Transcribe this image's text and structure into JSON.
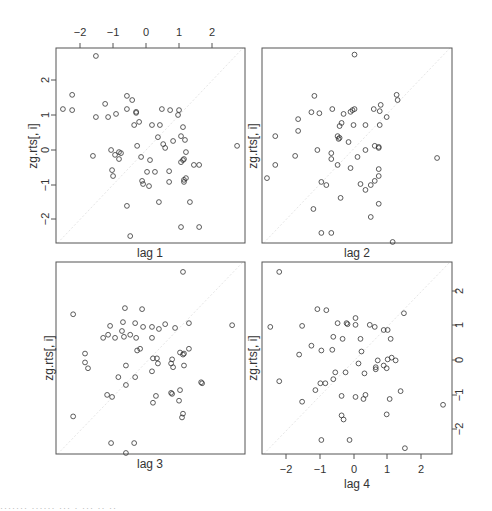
{
  "chart_data": {
    "type": "scatter",
    "title": "",
    "ylabel": "zg.rts[, i]",
    "axis_ticks": [
      -2,
      -1,
      0,
      1,
      2
    ],
    "xlim": [
      -2.73,
      3.0
    ],
    "ylim": [
      -2.68,
      2.94
    ],
    "grid": false,
    "reference_line": "y = x (faint dotted diagonal)",
    "panels": [
      {
        "xlabel": "lag 1",
        "position": "top-left",
        "axes": "top x-axis ticks, left y-axis ticks",
        "points": [
          [
            -1.52,
            2.71
          ],
          [
            -2.24,
            1.59
          ],
          [
            -2.52,
            1.18
          ],
          [
            -2.24,
            1.15
          ],
          [
            -1.24,
            1.33
          ],
          [
            -1.52,
            0.95
          ],
          [
            -1.15,
            0.95
          ],
          [
            -0.91,
            1.04
          ],
          [
            -0.58,
            1.56
          ],
          [
            -0.42,
            1.44
          ],
          [
            -0.58,
            1.18
          ],
          [
            -0.3,
            1.07
          ],
          [
            -0.3,
            1.1
          ],
          [
            -0.21,
            0.81
          ],
          [
            -0.36,
            0.72
          ],
          [
            0.48,
            1.18
          ],
          [
            0.73,
            1.15
          ],
          [
            1.0,
            1.15
          ],
          [
            0.42,
            0.72
          ],
          [
            0.18,
            0.72
          ],
          [
            0.36,
            0.37
          ],
          [
            1.12,
            0.66
          ],
          [
            1.06,
            0.4
          ],
          [
            0.97,
            1.01
          ],
          [
            1.18,
            0.29
          ],
          [
            0.82,
            0.26
          ],
          [
            0.52,
            0.17
          ],
          [
            0.58,
            0.06
          ],
          [
            -0.27,
            0.12
          ],
          [
            -1.06,
            0.0
          ],
          [
            -0.82,
            -0.06
          ],
          [
            -0.94,
            -0.14
          ],
          [
            -0.76,
            -0.09
          ],
          [
            -0.82,
            -0.26
          ],
          [
            -1.61,
            -0.17
          ],
          [
            -0.15,
            -0.2
          ],
          [
            0.12,
            -0.29
          ],
          [
            0.03,
            -0.63
          ],
          [
            -1.03,
            -0.58
          ],
          [
            -1.0,
            -0.75
          ],
          [
            0.27,
            -0.63
          ],
          [
            0.7,
            -0.61
          ],
          [
            -0.12,
            -0.89
          ],
          [
            -0.09,
            -0.98
          ],
          [
            0.09,
            -1.04
          ],
          [
            0.7,
            -0.92
          ],
          [
            1.15,
            -0.86
          ],
          [
            1.15,
            -0.92
          ],
          [
            1.21,
            -0.81
          ],
          [
            1.45,
            -0.43
          ],
          [
            1.61,
            -0.43
          ],
          [
            1.21,
            -0.06
          ],
          [
            1.15,
            -0.26
          ],
          [
            1.12,
            -0.29
          ],
          [
            1.06,
            -0.35
          ],
          [
            2.76,
            0.12
          ],
          [
            0.39,
            -1.5
          ],
          [
            -0.58,
            -1.61
          ],
          [
            1.33,
            -1.5
          ],
          [
            1.06,
            -2.22
          ],
          [
            1.61,
            -2.22
          ],
          [
            -0.48,
            -2.48
          ]
        ]
      },
      {
        "xlabel": "lag 2",
        "position": "top-right",
        "axes": "no tick labels",
        "points": [
          [
            0.06,
            2.75
          ],
          [
            -1.15,
            1.56
          ],
          [
            1.33,
            1.59
          ],
          [
            1.36,
            1.44
          ],
          [
            -1.24,
            1.09
          ],
          [
            -1.0,
            1.06
          ],
          [
            -0.61,
            1.18
          ],
          [
            -0.27,
            1.04
          ],
          [
            -0.06,
            1.1
          ],
          [
            0.0,
            1.15
          ],
          [
            0.06,
            1.18
          ],
          [
            0.64,
            1.18
          ],
          [
            0.82,
            1.12
          ],
          [
            0.85,
            1.3
          ],
          [
            1.03,
            0.95
          ],
          [
            -0.39,
            0.69
          ],
          [
            -0.33,
            0.78
          ],
          [
            0.03,
            0.72
          ],
          [
            0.39,
            0.72
          ],
          [
            0.82,
            0.72
          ],
          [
            -1.64,
            0.89
          ],
          [
            -2.33,
            0.4
          ],
          [
            -1.64,
            0.55
          ],
          [
            -0.45,
            0.4
          ],
          [
            -0.39,
            0.35
          ],
          [
            -0.42,
            0.32
          ],
          [
            -0.12,
            0.23
          ],
          [
            0.67,
            0.12
          ],
          [
            0.79,
            0.06
          ],
          [
            0.79,
            0.09
          ],
          [
            -1.06,
            0.0
          ],
          [
            -0.64,
            -0.09
          ],
          [
            -1.73,
            -0.17
          ],
          [
            -0.64,
            -0.26
          ],
          [
            -0.45,
            -0.43
          ],
          [
            -0.06,
            -0.52
          ],
          [
            0.15,
            -0.2
          ],
          [
            0.39,
            0.0
          ],
          [
            0.79,
            -0.55
          ],
          [
            0.79,
            -0.75
          ],
          [
            0.67,
            -0.89
          ],
          [
            -2.33,
            -0.43
          ],
          [
            -2.58,
            -0.81
          ],
          [
            -0.94,
            -0.92
          ],
          [
            -0.79,
            -1.01
          ],
          [
            0.24,
            -0.98
          ],
          [
            0.39,
            -1.15
          ],
          [
            0.55,
            -1.01
          ],
          [
            0.79,
            -1.55
          ],
          [
            -0.36,
            -1.38
          ],
          [
            -1.18,
            -1.7
          ],
          [
            0.55,
            -1.93
          ],
          [
            2.55,
            -0.23
          ],
          [
            -0.94,
            -2.39
          ],
          [
            -0.64,
            -2.39
          ],
          [
            1.21,
            -2.65
          ]
        ]
      },
      {
        "xlabel": "lag 3",
        "position": "bottom-left",
        "axes": "no tick labels",
        "points": [
          [
            1.12,
            2.65
          ],
          [
            -2.21,
            1.41
          ],
          [
            -0.64,
            1.59
          ],
          [
            -0.12,
            1.56
          ],
          [
            -0.7,
            1.18
          ],
          [
            -0.33,
            1.15
          ],
          [
            -0.48,
            0.81
          ],
          [
            -0.09,
            1.04
          ],
          [
            0.18,
            1.04
          ],
          [
            0.39,
            0.98
          ],
          [
            -0.73,
            0.92
          ],
          [
            0.88,
            1.01
          ],
          [
            0.58,
            1.12
          ],
          [
            1.3,
            1.15
          ],
          [
            2.61,
            1.09
          ],
          [
            -1.15,
            0.81
          ],
          [
            -1.09,
            1.07
          ],
          [
            -1.3,
            0.72
          ],
          [
            -0.94,
            0.72
          ],
          [
            -0.67,
            0.75
          ],
          [
            -0.3,
            0.72
          ],
          [
            0.18,
            0.72
          ],
          [
            -0.27,
            0.35
          ],
          [
            -0.18,
            0.4
          ],
          [
            0.21,
            0.12
          ],
          [
            0.33,
            0.12
          ],
          [
            0.79,
            0.09
          ],
          [
            1.03,
            0.29
          ],
          [
            1.12,
            0.23
          ],
          [
            1.15,
            0.26
          ],
          [
            1.3,
            0.4
          ],
          [
            0.36,
            -0.03
          ],
          [
            0.76,
            -0.03
          ],
          [
            0.82,
            -0.14
          ],
          [
            -0.61,
            -0.09
          ],
          [
            -1.76,
            -0.17
          ],
          [
            -1.85,
            0.26
          ],
          [
            -1.85,
            0.0
          ],
          [
            0.18,
            -0.26
          ],
          [
            1.15,
            -0.09
          ],
          [
            -0.84,
            -0.43
          ],
          [
            -0.33,
            -0.43
          ],
          [
            1.67,
            -0.58
          ],
          [
            1.7,
            -0.61
          ],
          [
            -0.61,
            -0.66
          ],
          [
            0.76,
            -0.89
          ],
          [
            0.79,
            -0.92
          ],
          [
            1.03,
            -0.81
          ],
          [
            -1.18,
            -0.95
          ],
          [
            -1.03,
            -1.01
          ],
          [
            0.3,
            -0.98
          ],
          [
            0.21,
            -1.18
          ],
          [
            1.0,
            -1.12
          ],
          [
            1.12,
            -1.5
          ],
          [
            1.09,
            -1.61
          ],
          [
            -2.21,
            -1.58
          ],
          [
            -1.06,
            -2.36
          ],
          [
            -0.36,
            -2.36
          ],
          [
            -0.61,
            -2.65
          ]
        ]
      },
      {
        "xlabel": "lag 4",
        "position": "bottom-right",
        "axes": "bottom x-axis ticks, right y-axis ticks",
        "points": [
          [
            -2.21,
            2.65
          ],
          [
            -2.48,
            1.04
          ],
          [
            -1.52,
            1.07
          ],
          [
            -1.06,
            1.56
          ],
          [
            -0.79,
            1.53
          ],
          [
            -0.45,
            1.15
          ],
          [
            -0.15,
            1.12
          ],
          [
            -0.18,
            1.15
          ],
          [
            0.09,
            1.3
          ],
          [
            0.09,
            1.1
          ],
          [
            0.52,
            1.1
          ],
          [
            0.67,
            1.04
          ],
          [
            0.94,
            0.95
          ],
          [
            1.06,
            0.95
          ],
          [
            1.15,
            0.69
          ],
          [
            1.55,
            1.44
          ],
          [
            -0.58,
            0.75
          ],
          [
            -0.3,
            0.69
          ],
          [
            0.24,
            0.69
          ],
          [
            -1.24,
            0.49
          ],
          [
            -0.94,
            0.35
          ],
          [
            -0.61,
            0.37
          ],
          [
            0.27,
            0.32
          ],
          [
            -1.61,
            0.23
          ],
          [
            0.18,
            -0.03
          ],
          [
            0.76,
            0.06
          ],
          [
            1.06,
            0.09
          ],
          [
            1.18,
            0.14
          ],
          [
            1.3,
            0.06
          ],
          [
            0.94,
            -0.09
          ],
          [
            1.03,
            -0.17
          ],
          [
            0.7,
            -0.14
          ],
          [
            0.7,
            -0.2
          ],
          [
            -0.52,
            -0.29
          ],
          [
            -0.21,
            -0.29
          ],
          [
            0.36,
            -0.32
          ],
          [
            -0.58,
            -0.49
          ],
          [
            -2.21,
            -0.55
          ],
          [
            -0.97,
            -0.61
          ],
          [
            -0.82,
            -0.61
          ],
          [
            -1.12,
            -0.81
          ],
          [
            1.45,
            -0.84
          ],
          [
            -0.33,
            -0.98
          ],
          [
            0.09,
            -1.01
          ],
          [
            0.39,
            -0.95
          ],
          [
            0.33,
            -1.07
          ],
          [
            1.12,
            -1.07
          ],
          [
            -1.52,
            -1.15
          ],
          [
            -0.33,
            -1.55
          ],
          [
            -0.27,
            -1.67
          ],
          [
            1.03,
            -1.52
          ],
          [
            2.73,
            -1.24
          ],
          [
            -0.94,
            -2.27
          ],
          [
            -0.09,
            -2.27
          ],
          [
            1.58,
            -2.51
          ]
        ]
      }
    ]
  },
  "labels": {
    "ylabel": "zg.rts[, i]",
    "xlabels": [
      "lag 1",
      "lag 2",
      "lag 3",
      "lag 4"
    ],
    "ticks": [
      "−2",
      "−1",
      "0",
      "1",
      "2"
    ]
  },
  "footer": {
    "clipped_text": "·······  ······  ···  · ··· ·· ··"
  },
  "style": {
    "axis_color": "#555555",
    "point_color": "#333333",
    "text_color": "#333333",
    "diagonal_color": "#e6e6e6"
  }
}
